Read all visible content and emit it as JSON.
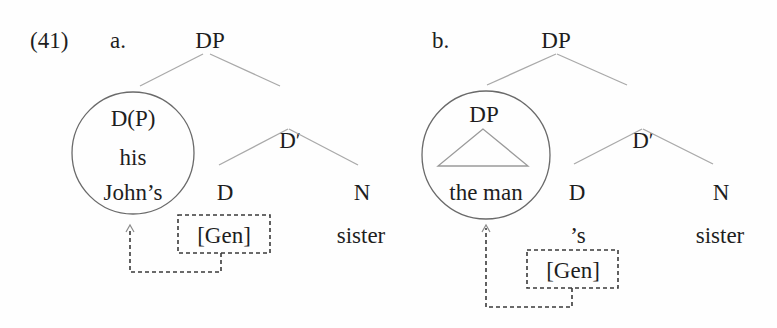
{
  "example_number": "(41)",
  "colors": {
    "text": "#1e1e1e",
    "branch_lines": "#a9a9a9",
    "circle": "#6a6a6a",
    "dashed": "#3a3a3a",
    "background": "#fefefe"
  },
  "trees": [
    {
      "label": "a.",
      "root": "DP",
      "specifier": {
        "circled": true,
        "category": "D(P)",
        "lines": [
          "his",
          "John’s"
        ]
      },
      "bar": "D′",
      "head": {
        "category": "D",
        "content": "",
        "feature": "[Gen]"
      },
      "complement": {
        "category": "N",
        "content": "sister"
      },
      "arrow": {
        "from": "[Gen]",
        "to": "specifier",
        "style": "dashed"
      }
    },
    {
      "label": "b.",
      "root": "DP",
      "specifier": {
        "circled": true,
        "category": "DP",
        "triangle": true,
        "lines": [
          "the man"
        ]
      },
      "bar": "D′",
      "head": {
        "category": "D",
        "content": "’s",
        "feature": "[Gen]"
      },
      "complement": {
        "category": "N",
        "content": "sister"
      },
      "arrow": {
        "from": "[Gen]",
        "to": "specifier",
        "style": "dashed"
      }
    }
  ]
}
